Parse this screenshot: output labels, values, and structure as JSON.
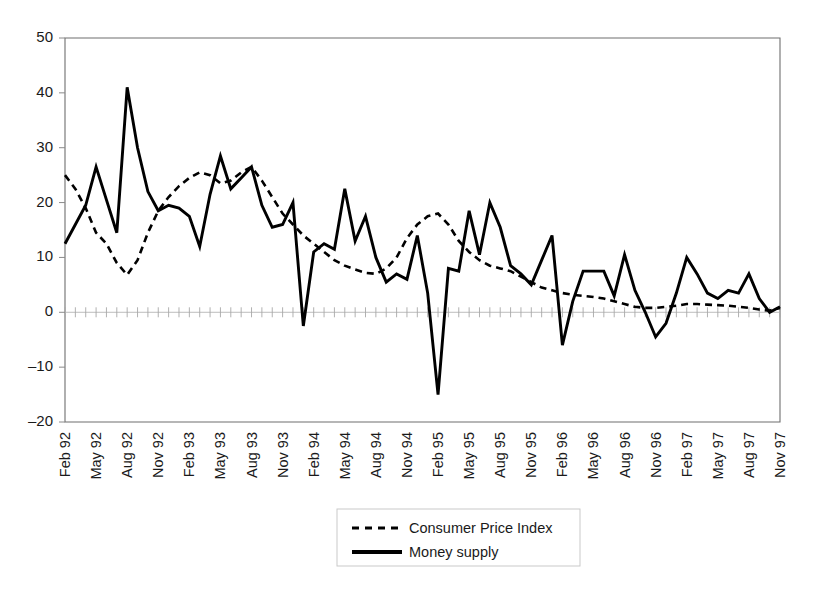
{
  "chart_data": {
    "type": "line",
    "title": "",
    "xlabel": "",
    "ylabel": "",
    "ylim": [
      -20,
      50
    ],
    "yticks": [
      -20,
      -10,
      0,
      10,
      20,
      30,
      40,
      50
    ],
    "grid": false,
    "legend_position": "bottom-center",
    "x_tick_labels": [
      "Feb 92",
      "May 92",
      "Aug 92",
      "Nov 92",
      "Feb 93",
      "May 93",
      "Aug 93",
      "Nov 93",
      "Feb 94",
      "May 94",
      "Aug 94",
      "Nov 94",
      "Feb 95",
      "May 95",
      "Aug 95",
      "Nov 95",
      "Feb 96",
      "May 96",
      "Aug 96",
      "Nov 96",
      "Feb 97",
      "May 97",
      "Aug 97",
      "Nov 97"
    ],
    "x_tick_label_interval": 3,
    "x": [
      "Feb 92",
      "Mar 92",
      "Apr 92",
      "May 92",
      "Jun 92",
      "Jul 92",
      "Aug 92",
      "Sep 92",
      "Oct 92",
      "Nov 92",
      "Dec 92",
      "Jan 93",
      "Feb 93",
      "Mar 93",
      "Apr 93",
      "May 93",
      "Jun 93",
      "Jul 93",
      "Aug 93",
      "Sep 93",
      "Oct 93",
      "Nov 93",
      "Dec 93",
      "Jan 94",
      "Feb 94",
      "Mar 94",
      "Apr 94",
      "May 94",
      "Jun 94",
      "Jul 94",
      "Aug 94",
      "Sep 94",
      "Oct 94",
      "Nov 94",
      "Dec 94",
      "Jan 95",
      "Feb 95",
      "Mar 95",
      "Apr 95",
      "May 95",
      "Jun 95",
      "Jul 95",
      "Aug 95",
      "Sep 95",
      "Oct 95",
      "Nov 95",
      "Dec 95",
      "Jan 96",
      "Feb 96",
      "Mar 96",
      "Apr 96",
      "May 96",
      "Jun 96",
      "Jul 96",
      "Aug 96",
      "Sep 96",
      "Oct 96",
      "Nov 96",
      "Dec 96",
      "Jan 97",
      "Feb 97",
      "Mar 97",
      "Apr 97",
      "May 97",
      "Jun 97",
      "Jul 97",
      "Aug 97",
      "Sep 97",
      "Oct 97",
      "Nov 97"
    ],
    "series": [
      {
        "name": "Consumer Price Index",
        "style": "dashed",
        "color": "#000000",
        "values": [
          25.0,
          22.5,
          19.0,
          14.5,
          12.5,
          9.0,
          6.8,
          9.5,
          14.5,
          18.5,
          21.0,
          23.0,
          24.5,
          25.5,
          25.0,
          23.5,
          24.0,
          25.5,
          26.5,
          24.0,
          21.0,
          18.0,
          16.0,
          14.0,
          12.5,
          11.0,
          9.5,
          8.5,
          7.8,
          7.2,
          7.0,
          8.0,
          10.0,
          13.5,
          16.0,
          17.5,
          18.0,
          16.0,
          13.0,
          11.0,
          9.5,
          8.5,
          8.0,
          7.5,
          6.5,
          5.5,
          4.5,
          4.0,
          3.5,
          3.2,
          3.0,
          2.8,
          2.5,
          2.0,
          1.5,
          1.0,
          0.8,
          0.8,
          1.0,
          1.2,
          1.5,
          1.5,
          1.4,
          1.3,
          1.2,
          1.0,
          0.8,
          0.5,
          0.3,
          0.8
        ]
      },
      {
        "name": "Money supply",
        "style": "solid",
        "color": "#000000",
        "values": [
          12.5,
          16.0,
          19.5,
          26.5,
          20.5,
          14.5,
          41.0,
          30.0,
          22.0,
          18.5,
          19.5,
          19.0,
          17.5,
          12.0,
          21.5,
          28.5,
          22.5,
          24.5,
          26.5,
          19.5,
          15.5,
          16.0,
          20.0,
          -2.5,
          11.0,
          12.5,
          11.5,
          22.5,
          13.0,
          17.5,
          10.0,
          5.5,
          7.0,
          6.0,
          14.0,
          3.5,
          -15.0,
          8.0,
          7.5,
          18.5,
          10.5,
          20.0,
          15.5,
          8.5,
          7.0,
          5.0,
          9.5,
          14.0,
          -6.0,
          2.0,
          7.5,
          7.5,
          7.5,
          3.0,
          10.5,
          4.0,
          0.0,
          -4.5,
          -2.0,
          3.5,
          10.0,
          7.0,
          3.5,
          2.5,
          4.0,
          3.5,
          7.0,
          2.5,
          0.0,
          1.0
        ]
      }
    ]
  },
  "legend": {
    "items": [
      {
        "label": "Consumer Price Index",
        "style": "dashed"
      },
      {
        "label": "Money supply",
        "style": "solid"
      }
    ]
  }
}
